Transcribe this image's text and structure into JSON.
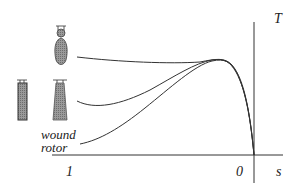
{
  "diagram": {
    "title": "",
    "axes": {
      "y_label": "T",
      "x_label": "s",
      "x_ticks": [
        {
          "label": "1",
          "position": "left"
        },
        {
          "label": "0",
          "position": "right"
        }
      ]
    },
    "annotations": {
      "wound_rotor_line1": "wound",
      "wound_rotor_line2": "rotor"
    },
    "rotor_icons": [
      {
        "name": "double-cage-rotor-bar",
        "shape": "bulb-top-teardrop"
      },
      {
        "name": "deep-bar-rotor-bar",
        "shape": "rectangle"
      },
      {
        "name": "tapered-bar-rotor-bar",
        "shape": "trapezoid"
      }
    ],
    "curves": [
      {
        "name": "double-cage-curve",
        "description": "high starting torque, nearly flat to peak"
      },
      {
        "name": "deep-bar-curve",
        "description": "medium starting torque, dips then rises to peak"
      },
      {
        "name": "wound-rotor-curve",
        "description": "low starting torque, rising to peak"
      }
    ],
    "colors": {
      "line": "#333333",
      "bar_fill": "#8a8a8a",
      "bar_stroke": "#333333"
    }
  }
}
